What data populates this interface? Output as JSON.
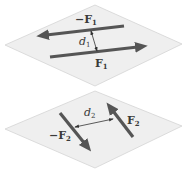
{
  "figure": {
    "top_plane": {
      "force_neg_label": "−F",
      "force_neg_sub": "1",
      "force_pos_label": "F",
      "force_pos_sub": "1",
      "distance_label": "d",
      "distance_sub": "1"
    },
    "bottom_plane": {
      "force_neg_label": "−F",
      "force_neg_sub": "2",
      "force_pos_label": "F",
      "force_pos_sub": "2",
      "distance_label": "d",
      "distance_sub": "2"
    },
    "colors": {
      "plane_fill": "#efefef",
      "plane_edge": "#d4d4d4",
      "force_arrow": "#555555",
      "distance_arrow": "#333333",
      "label_text": "#3a3a3a"
    }
  }
}
